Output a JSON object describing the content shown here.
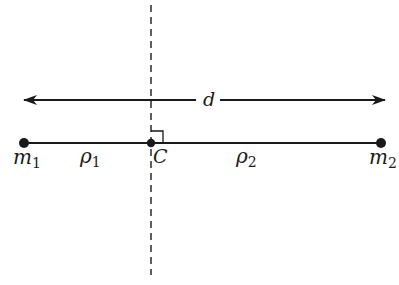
{
  "diagram": {
    "title": "",
    "colors": {
      "stroke": "#1a1a1a",
      "background": "#ffffff"
    },
    "distance_arrow": {
      "label": "d",
      "x_start": 24,
      "x_end": 385,
      "y": 100,
      "gap_start": 196,
      "gap_end": 220
    },
    "axis_line": {
      "style": "dashed",
      "x": 151,
      "y_start": 5,
      "y_end": 275
    },
    "connecting_line": {
      "x_start": 24,
      "x_end": 381,
      "y": 143
    },
    "points": [
      {
        "id": "m1",
        "label": "m",
        "subscript": "1",
        "x": 24,
        "y": 143,
        "label_x": 13,
        "label_y": 164
      },
      {
        "id": "C",
        "label": "C",
        "subscript": "",
        "x": 151,
        "y": 143,
        "label_x": 153,
        "label_y": 163
      },
      {
        "id": "m2",
        "label": "m",
        "subscript": "2",
        "x": 381,
        "y": 143,
        "label_x": 369,
        "label_y": 164
      }
    ],
    "segment_labels": [
      {
        "id": "rho1",
        "label": "ρ",
        "subscript": "1",
        "x": 80,
        "y": 163
      },
      {
        "id": "rho2",
        "label": "ρ",
        "subscript": "2",
        "x": 236,
        "y": 163
      }
    ],
    "right_angle_marker": {
      "x": 151,
      "y": 143,
      "size": 12
    }
  }
}
